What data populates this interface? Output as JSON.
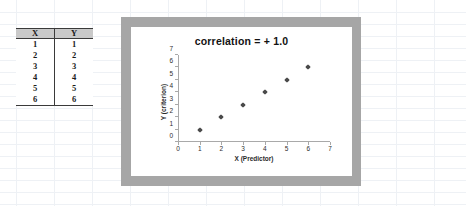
{
  "spreadsheet": {
    "table": {
      "headers": [
        "X",
        "Y"
      ],
      "rows": [
        [
          "1",
          "1"
        ],
        [
          "2",
          "2"
        ],
        [
          "3",
          "3"
        ],
        [
          "4",
          "4"
        ],
        [
          "5",
          "5"
        ],
        [
          "6",
          "6"
        ]
      ]
    }
  },
  "chart_data": {
    "type": "scatter",
    "title": "correlation = + 1.0",
    "xlabel": "X (Predictor)",
    "ylabel": "Y (criterion)",
    "x": [
      1,
      2,
      3,
      4,
      5,
      6
    ],
    "values": [
      1,
      2,
      3,
      4,
      5,
      6
    ],
    "series": [
      {
        "name": "Series 1",
        "points": [
          {
            "x": 1,
            "y": 1
          },
          {
            "x": 2,
            "y": 2
          },
          {
            "x": 3,
            "y": 3
          },
          {
            "x": 4,
            "y": 4
          },
          {
            "x": 5,
            "y": 5
          },
          {
            "x": 6,
            "y": 6
          }
        ]
      }
    ],
    "xlim": [
      0,
      7
    ],
    "ylim": [
      0,
      7
    ],
    "xticks": [
      "0",
      "1",
      "2",
      "3",
      "4",
      "5",
      "6",
      "7"
    ],
    "yticks": [
      "0",
      "1",
      "2",
      "3",
      "4",
      "5",
      "6",
      "7"
    ],
    "grid": false,
    "legend": false,
    "marker": "diamond",
    "marker_color": "#4a4a4a",
    "frame_color": "#a6a6a6",
    "plot_background": "#ffffff"
  }
}
